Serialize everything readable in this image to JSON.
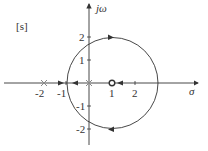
{
  "diagram": {
    "plane_label": "[s]",
    "axes": {
      "real_label": "σ",
      "imag_label": "jω",
      "x_ticks": [
        "-2",
        "-1",
        "1",
        "2"
      ],
      "y_ticks": [
        "2",
        "1",
        "-1",
        "-2"
      ]
    },
    "poles": [
      {
        "re": -2,
        "im": 0
      },
      {
        "re": 0,
        "im": 0
      }
    ],
    "zeros": [
      {
        "re": 1,
        "im": 0
      }
    ],
    "root_locus_circle": {
      "center_re": 1,
      "center_im": 0,
      "radius": 2
    },
    "colors": {
      "line": "#333333",
      "pole": "#888888"
    }
  }
}
